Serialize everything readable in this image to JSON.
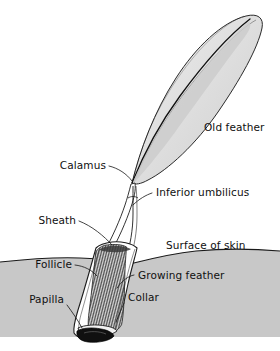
{
  "figure": {
    "background_color": "#ffffff",
    "ink_color": "#1a1a1a",
    "skin_fill_color": "#c8c8c8",
    "vane_fill_color": "#e3e3e3",
    "papilla_fill_color": "#101010"
  },
  "labels": {
    "old_feather": "Old feather",
    "calamus": "Calamus",
    "inferior_umbilicus": "Inferior umbilicus",
    "sheath": "Sheath",
    "surface_of_skin": "Surface of skin",
    "follicle": "Follicle",
    "growing_feather": "Growing feather",
    "papilla": "Papilla",
    "collar": "Collar"
  },
  "structures": [
    {
      "name": "old-feather",
      "label": "Old feather"
    },
    {
      "name": "calamus",
      "label": "Calamus"
    },
    {
      "name": "inferior-umbilicus",
      "label": "Inferior umbilicus"
    },
    {
      "name": "sheath",
      "label": "Sheath"
    },
    {
      "name": "skin-surface",
      "label": "Surface of skin"
    },
    {
      "name": "follicle",
      "label": "Follicle"
    },
    {
      "name": "growing-feather",
      "label": "Growing feather"
    },
    {
      "name": "papilla",
      "label": "Papilla"
    },
    {
      "name": "collar",
      "label": "Collar"
    }
  ]
}
